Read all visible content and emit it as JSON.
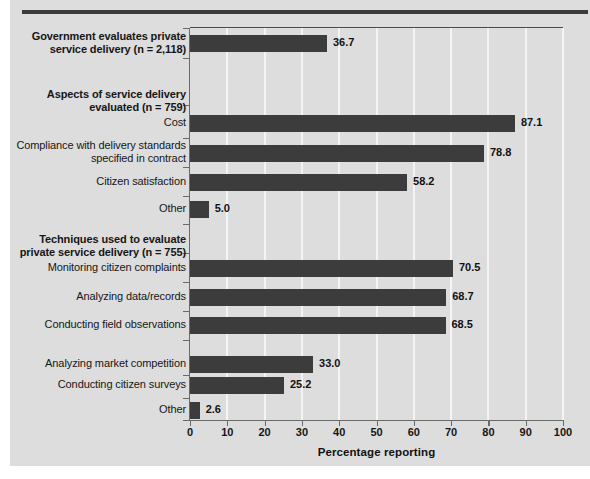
{
  "chart_data": {
    "type": "bar",
    "orientation": "horizontal",
    "title": "",
    "xlabel": "Percentage reporting",
    "ylabel": "",
    "xlim": [
      0,
      100
    ],
    "xticks": [
      0,
      10,
      20,
      30,
      40,
      50,
      60,
      70,
      80,
      90,
      100
    ],
    "xticklabels": [
      "0",
      "10",
      "20",
      "30",
      "40",
      "50",
      "60",
      "70",
      "80",
      "90",
      "100"
    ],
    "grid": "vertical-white-gridlines",
    "legend": "none",
    "bar_color": "#3c3c3c",
    "background_color": "#dddddd",
    "groups": [
      {
        "header": "Government evaluates private\nservice delivery (n = 2,118)",
        "items": [
          {
            "label": "",
            "value": 36.7,
            "value_label": "36.7"
          }
        ]
      },
      {
        "header": "Aspects of service delivery\nevaluated (n = 759)",
        "items": [
          {
            "label": "Cost",
            "value": 87.1,
            "value_label": "87.1"
          },
          {
            "label": "Compliance with delivery standards\nspecified in contract",
            "value": 78.8,
            "value_label": "78.8"
          },
          {
            "label": "Citizen satisfaction",
            "value": 58.2,
            "value_label": "58.2"
          },
          {
            "label": "Other",
            "value": 5.0,
            "value_label": "5.0"
          }
        ]
      },
      {
        "header": "Techniques used to evaluate\nprivate service delivery (n = 755)",
        "items": [
          {
            "label": "Monitoring citizen complaints",
            "value": 70.5,
            "value_label": "70.5"
          },
          {
            "label": "Analyzing data/records",
            "value": 68.7,
            "value_label": "68.7"
          },
          {
            "label": "Conducting field observations",
            "value": 68.5,
            "value_label": "68.5"
          },
          {
            "label": "Analyzing market competition",
            "value": 33.0,
            "value_label": "33.0"
          },
          {
            "label": "Conducting citizen surveys",
            "value": 25.2,
            "value_label": "25.2"
          },
          {
            "label": "Other",
            "value": 2.6,
            "value_label": "2.6"
          }
        ]
      }
    ],
    "categories": [
      "Government evaluates private service delivery (n = 2,118)",
      "Cost",
      "Compliance with delivery standards specified in contract",
      "Citizen satisfaction",
      "Other",
      "Monitoring citizen complaints",
      "Analyzing data/records",
      "Conducting field observations",
      "Analyzing market competition",
      "Conducting citizen surveys",
      "Other"
    ],
    "values": [
      36.7,
      87.1,
      78.8,
      58.2,
      5.0,
      70.5,
      68.7,
      68.5,
      33.0,
      25.2,
      2.6
    ]
  },
  "labels": {
    "group1_header": "Government evaluates private\nservice delivery (n = 2,118)",
    "group2_header": "Aspects of service delivery\nevaluated (n = 759)",
    "group3_header": "Techniques used to evaluate\nprivate service delivery (n = 755)",
    "cost": "Cost",
    "compliance": "Compliance with delivery standards\nspecified in contract",
    "citizen_satisfaction": "Citizen satisfaction",
    "other_a": "Other",
    "monitoring": "Monitoring citizen complaints",
    "analyzing_data": "Analyzing data/records",
    "field_observations": "Conducting field observations",
    "market_competition": "Analyzing market competition",
    "citizen_surveys": "Conducting citizen surveys",
    "other_b": "Other",
    "axis_title": "Percentage reporting"
  },
  "values_text": {
    "v1": "36.7",
    "v2": "87.1",
    "v3": "78.8",
    "v4": "58.2",
    "v5": "5.0",
    "v6": "70.5",
    "v7": "68.7",
    "v8": "68.5",
    "v9": "33.0",
    "v10": "25.2",
    "v11": "2.6"
  }
}
